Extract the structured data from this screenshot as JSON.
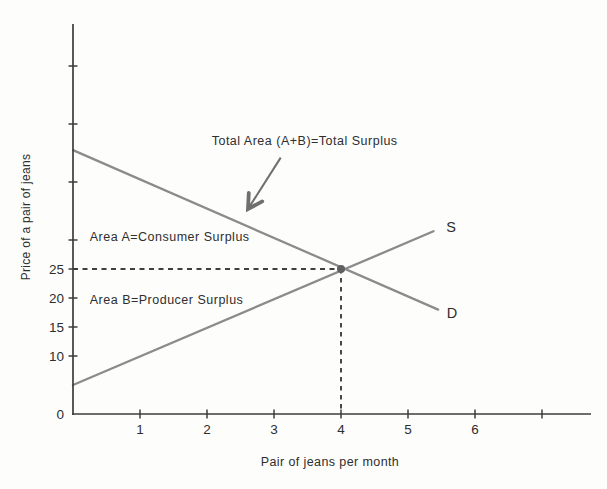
{
  "colors": {
    "background": "#fdfdfc",
    "axis": "#3d3d3d",
    "curve": "#8b8b8b",
    "dashed": "#3f3f3f",
    "dot": "#5f5f5f",
    "arrow": "#6f6f6f",
    "text": "#2e2e2e"
  },
  "chart_data": {
    "type": "line",
    "title": "",
    "xlabel": "Pair of jeans per month",
    "ylabel": "Price of a pair of jeans",
    "xlim": [
      0,
      7.75
    ],
    "ylim": [
      0,
      67
    ],
    "grid": false,
    "legend": "none",
    "x_ticks": [
      {
        "value": 1,
        "label": "1"
      },
      {
        "value": 2,
        "label": "2"
      },
      {
        "value": 3,
        "label": "3"
      },
      {
        "value": 4,
        "label": "4"
      },
      {
        "value": 5,
        "label": "5"
      },
      {
        "value": 6,
        "label": "6"
      },
      {
        "value": 7,
        "label": ""
      }
    ],
    "y_ticks": [
      {
        "value": 0,
        "label": "0"
      },
      {
        "value": 10,
        "label": "10"
      },
      {
        "value": 15,
        "label": "15"
      },
      {
        "value": 20,
        "label": "20"
      },
      {
        "value": 25,
        "label": "25"
      },
      {
        "value": 30,
        "label": ""
      },
      {
        "value": 40,
        "label": ""
      },
      {
        "value": 50,
        "label": ""
      },
      {
        "value": 60,
        "label": ""
      }
    ],
    "series": [
      {
        "name": "supply-curve",
        "curve_label": "S",
        "points": [
          [
            0,
            5
          ],
          [
            5.38,
            31.5
          ]
        ],
        "label_x": 5.57,
        "label_y": 32.3
      },
      {
        "name": "demand-curve",
        "curve_label": "D",
        "points": [
          [
            0,
            45.5
          ],
          [
            5.45,
            18
          ]
        ],
        "label_x": 5.58,
        "label_y": 17.4
      }
    ],
    "equilibrium": {
      "x": 4,
      "y": 25,
      "price_label": "25",
      "quantity_label": "4"
    },
    "annotations": [
      {
        "name": "total-surplus-annotation",
        "text": "Total Area (A+B)=Total Surplus",
        "x": 2.07,
        "y": 47.1
      },
      {
        "name": "area-a-annotation",
        "text": "Area A=Consumer Surplus",
        "x": 0.25,
        "y": 30.5
      },
      {
        "name": "area-b-annotation",
        "text": "Area B=Producer Surplus",
        "x": 0.25,
        "y": 19.6
      }
    ],
    "arrow": {
      "from": [
        3.1,
        44.2
      ],
      "to": [
        2.62,
        35.5
      ]
    }
  }
}
